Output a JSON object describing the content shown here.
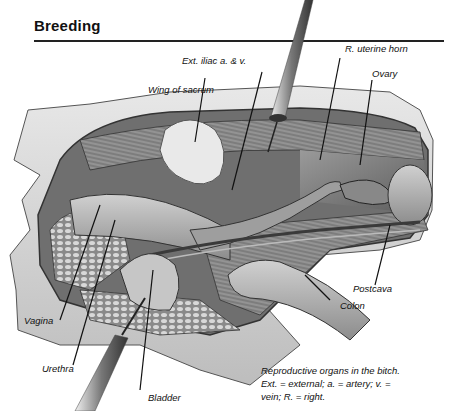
{
  "page": {
    "heading": "Breeding"
  },
  "figure": {
    "labels": {
      "ext_iliac": "Ext. iliac a. & v.",
      "r_uterine_horn": "R. uterine horn",
      "wing_of_sacrum": "Wing of sacrum",
      "ovary": "Ovary",
      "postcava": "Postcava",
      "colon": "Colon",
      "vagina": "Vagina",
      "urethra": "Urethra",
      "bladder": "Bladder"
    },
    "caption": {
      "line1": "Reproductive organs in the bitch.",
      "line2": "Ext. = external; a. = artery; v. =",
      "line3": "vein; R. = right."
    }
  }
}
